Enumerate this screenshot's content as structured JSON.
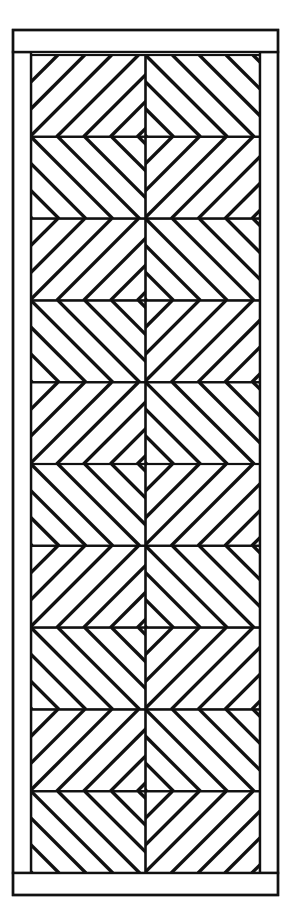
{
  "figure": {
    "kind": "line-drawing",
    "canvas": {
      "width": 296,
      "height": 904
    },
    "background_color": "#ffffff",
    "stroke_color": "#111111"
  },
  "frame": {
    "outer": {
      "x": 13,
      "y": 30,
      "width": 265,
      "height": 865,
      "stroke_width": 2.4
    },
    "top_rail": {
      "x": 13,
      "y": 30,
      "width": 265,
      "height": 22,
      "label": "top rail"
    },
    "bottom_rail": {
      "x": 13,
      "y": 873,
      "width": 265,
      "height": 22,
      "label": "bottom rail"
    },
    "left_stile": {
      "x": 13,
      "y": 52,
      "width": 18,
      "height": 821,
      "label": "left stile"
    },
    "right_stile": {
      "x": 260,
      "y": 52,
      "width": 18,
      "height": 821,
      "label": "right stile"
    }
  },
  "field": {
    "x": 31,
    "y": 55,
    "width": 229,
    "height": 818,
    "columns": 2,
    "rows": 10,
    "cell_width": 114.5,
    "cell_height": 81.8,
    "stroke_width": 2.2,
    "grid_stroke_width": 2.0,
    "center_column_x": 145.5
  },
  "stripes": {
    "spacing": 19,
    "thickness": 3.4,
    "angle_degrees": 45,
    "description": "45 degree diagonal banding, mirrored left/right about the centre stile and flipped row to row"
  },
  "chart_data": {
    "type": "table",
    "xlabel": "column",
    "ylabel": "row",
    "categories": [
      "left",
      "right"
    ],
    "rows": [
      {
        "row": 1,
        "left": "up-right",
        "right": "up-left",
        "motif": "chevron-up"
      },
      {
        "row": 2,
        "left": "up-left",
        "right": "up-right",
        "motif": "chevron-down"
      },
      {
        "row": 3,
        "left": "up-right",
        "right": "up-left",
        "motif": "chevron-up"
      },
      {
        "row": 4,
        "left": "up-left",
        "right": "up-right",
        "motif": "chevron-down"
      },
      {
        "row": 5,
        "left": "up-right",
        "right": "up-left",
        "motif": "chevron-up"
      },
      {
        "row": 6,
        "left": "up-left",
        "right": "up-right",
        "motif": "chevron-down"
      },
      {
        "row": 7,
        "left": "up-right",
        "right": "up-left",
        "motif": "chevron-up"
      },
      {
        "row": 8,
        "left": "up-left",
        "right": "up-right",
        "motif": "chevron-down"
      },
      {
        "row": 9,
        "left": "up-right",
        "right": "up-left",
        "motif": "chevron-up"
      },
      {
        "row": 10,
        "left": "up-left",
        "right": "up-right",
        "motif": "chevron-down"
      }
    ]
  }
}
